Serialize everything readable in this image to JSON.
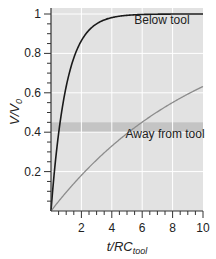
{
  "chart_data": {
    "type": "line",
    "title": "",
    "xlabel": "t/RC_tool",
    "xlabel_main": "t/RC",
    "xlabel_sub": "tool",
    "ylabel": "V/V_0",
    "ylabel_main": "V/V",
    "ylabel_sub": "0",
    "xlim": [
      0,
      10
    ],
    "ylim": [
      0,
      1
    ],
    "x_ticks": [
      2,
      4,
      6,
      8,
      10
    ],
    "x_tick_labels": [
      "2",
      "4",
      "6",
      "8",
      "10"
    ],
    "y_ticks": [
      0.2,
      0.4,
      0.6,
      0.8,
      1
    ],
    "y_tick_labels": [
      "0.2",
      "0.4",
      "0.6",
      "0.8",
      "1"
    ],
    "grid": true,
    "background": "#e2e2e2",
    "band": {
      "y_from": 0.4,
      "y_to": 0.45,
      "color": "#c4c4c4"
    },
    "series": [
      {
        "name": "Below tool",
        "color": "#1a1a1a",
        "formula": "1 - exp(-t/1)",
        "x": [
          0,
          0.25,
          0.5,
          0.75,
          1,
          1.5,
          2,
          3,
          4,
          5,
          6,
          8,
          10
        ],
        "values": [
          0,
          0.22,
          0.39,
          0.53,
          0.63,
          0.78,
          0.86,
          0.95,
          0.98,
          0.99,
          1.0,
          1.0,
          1.0
        ]
      },
      {
        "name": "Away from tool",
        "color": "#8c8c8c",
        "formula": "1 - exp(-t/10)",
        "x": [
          0,
          1,
          2,
          3,
          4,
          5,
          6,
          7,
          8,
          9,
          10
        ],
        "values": [
          0,
          0.1,
          0.18,
          0.26,
          0.33,
          0.39,
          0.45,
          0.5,
          0.55,
          0.59,
          0.63
        ]
      }
    ],
    "annotations": [
      {
        "text": "Below tool",
        "x": 7.3,
        "y": 0.95
      },
      {
        "text": "Away from tool",
        "x": 7.5,
        "y": 0.37
      }
    ]
  }
}
